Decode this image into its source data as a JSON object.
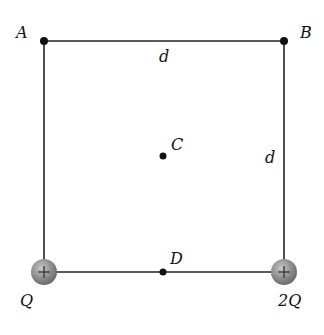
{
  "figure": {
    "type": "physics-diagram",
    "labels": {
      "A": "A",
      "B": "B",
      "C": "C",
      "D": "D",
      "top_side": "d",
      "right_side": "d",
      "left_charge": "Q",
      "right_charge": "2Q",
      "charge_sign": "+"
    },
    "colors": {
      "line": "#222222",
      "point": "#111111",
      "charge_fill": "#8a8a8a",
      "background": "#ffffff"
    }
  }
}
